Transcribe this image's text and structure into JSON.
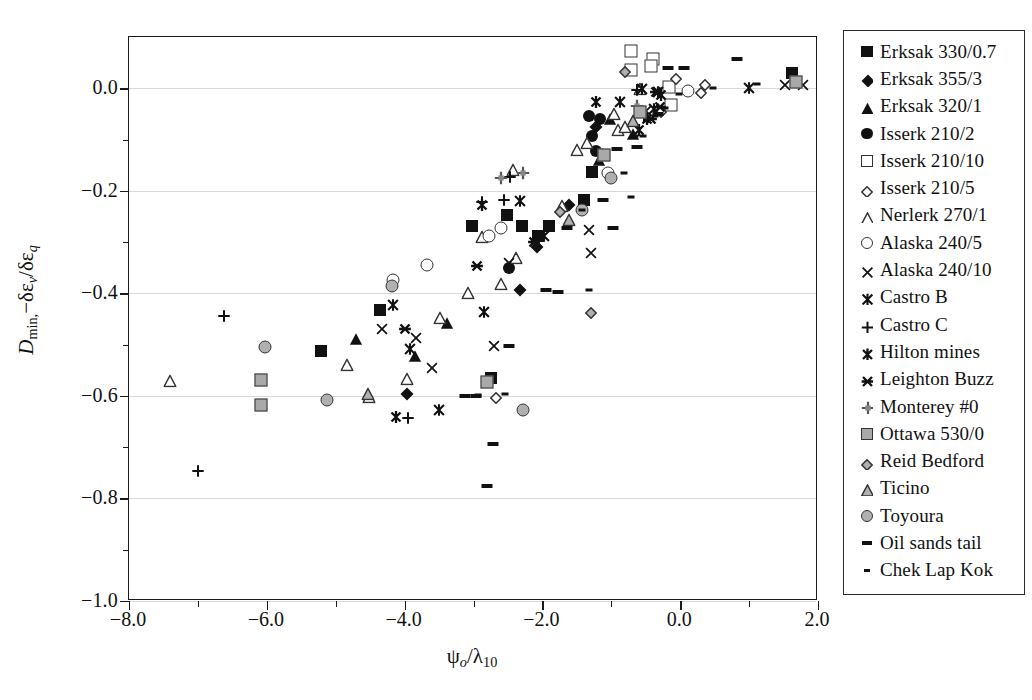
{
  "chart_data": {
    "type": "scatter",
    "title": "",
    "xlabel": "psi_o / lambda_10",
    "ylabel": "D_min, -delta-epsilon_v / delta-epsilon_q",
    "xlim": [
      -8.0,
      2.0
    ],
    "ylim": [
      -1.0,
      0.1
    ],
    "xticks": [
      "-8.0",
      "-6.0",
      "-4.0",
      "-2.0",
      "0.0",
      "2.0"
    ],
    "xtick_values": [
      -8.0,
      -6.0,
      -4.0,
      -2.0,
      0.0,
      2.0
    ],
    "xminor_values": [
      -7.0,
      -5.0,
      -3.0,
      -1.0,
      1.0
    ],
    "yticks": [
      "0.0",
      "-0.2",
      "-0.4",
      "-0.6",
      "-0.8",
      "-1.0"
    ],
    "ytick_values": [
      0.0,
      -0.2,
      -0.4,
      -0.6,
      -0.8,
      -1.0
    ],
    "yminor_values": [
      -0.1,
      -0.3,
      -0.5,
      -0.7,
      -0.9
    ],
    "grid": true,
    "grid_axis": "y",
    "legend_position": "right-outside",
    "series": [
      {
        "name": "Erksak 330/0.7",
        "marker": "square-filled",
        "points": [
          [
            -5.22,
            -0.512
          ],
          [
            -4.35,
            -0.433
          ],
          [
            -3.02,
            -0.268
          ],
          [
            -2.52,
            -0.248
          ],
          [
            -2.3,
            -0.268
          ],
          [
            -2.07,
            -0.288
          ],
          [
            -1.9,
            -0.268
          ],
          [
            -2.74,
            -0.565
          ],
          [
            -1.4,
            -0.218
          ],
          [
            -1.28,
            -0.163
          ],
          [
            1.62,
            0.03
          ]
        ]
      },
      {
        "name": "Erksak 355/3",
        "marker": "diamond-filled",
        "points": [
          [
            -3.96,
            -0.597
          ],
          [
            -2.08,
            -0.31
          ],
          [
            -1.62,
            -0.228
          ],
          [
            -2.33,
            -0.393
          ],
          [
            -1.22,
            -0.075
          ]
        ]
      },
      {
        "name": "Erksak 320/1",
        "marker": "triangle-filled",
        "points": [
          [
            -4.7,
            -0.487
          ],
          [
            -3.85,
            -0.52
          ],
          [
            -3.38,
            -0.455
          ],
          [
            -1.18,
            -0.138
          ],
          [
            -0.68,
            -0.088
          ],
          [
            -1.02,
            -0.058
          ]
        ]
      },
      {
        "name": "Isserk 210/2",
        "marker": "circle-filled",
        "points": [
          [
            -2.48,
            -0.35
          ],
          [
            -1.28,
            -0.093
          ],
          [
            -1.22,
            -0.123
          ],
          [
            -1.16,
            -0.06
          ],
          [
            -1.32,
            -0.055
          ]
        ]
      },
      {
        "name": "Isserk 210/10",
        "marker": "square-open",
        "points": [
          [
            -0.72,
            0.073
          ],
          [
            -0.72,
            0.035
          ],
          [
            -0.4,
            0.058
          ],
          [
            -0.42,
            0.043
          ],
          [
            -0.16,
            0.003
          ],
          [
            -0.14,
            -0.032
          ]
        ]
      },
      {
        "name": "Isserk 210/5",
        "marker": "diamond-small-open",
        "points": [
          [
            -2.68,
            -0.6
          ],
          [
            -0.06,
            0.022
          ],
          [
            0.36,
            0.01
          ],
          [
            0.3,
            -0.005
          ],
          [
            -0.28,
            -0.043
          ]
        ]
      },
      {
        "name": "Nerlerk 270/1",
        "marker": "triangle-open",
        "points": [
          [
            -7.4,
            -0.568
          ],
          [
            -4.83,
            -0.538
          ],
          [
            -4.52,
            -0.6
          ],
          [
            -3.96,
            -0.565
          ],
          [
            -3.48,
            -0.447
          ],
          [
            -3.08,
            -0.398
          ],
          [
            -2.88,
            -0.288
          ],
          [
            -2.6,
            -0.38
          ],
          [
            -2.43,
            -0.158
          ],
          [
            -2.38,
            -0.33
          ],
          [
            -1.72,
            -0.228
          ],
          [
            -1.5,
            -0.118
          ],
          [
            -1.35,
            -0.105
          ],
          [
            -1.12,
            -0.128
          ],
          [
            -0.96,
            -0.048
          ],
          [
            -0.9,
            -0.08
          ],
          [
            -0.8,
            -0.073
          ],
          [
            -0.58,
            0.0
          ]
        ]
      },
      {
        "name": "Alaska 240/5",
        "marker": "circle-open",
        "points": [
          [
            -4.17,
            -0.373
          ],
          [
            -3.67,
            -0.345
          ],
          [
            -2.78,
            -0.288
          ],
          [
            -2.6,
            -0.272
          ],
          [
            -1.05,
            -0.165
          ],
          [
            0.12,
            -0.005
          ]
        ]
      },
      {
        "name": "Alaska 240/10",
        "marker": "x-thin",
        "points": [
          [
            -4.33,
            -0.468
          ],
          [
            -3.83,
            -0.485
          ],
          [
            -3.6,
            -0.543
          ],
          [
            -2.7,
            -0.5
          ],
          [
            -2.48,
            -0.338
          ],
          [
            -1.33,
            -0.275
          ],
          [
            -1.3,
            -0.32
          ],
          [
            -0.5,
            -0.043
          ],
          [
            1.78,
            0.008
          ],
          [
            1.52,
            0.008
          ]
        ]
      },
      {
        "name": "Castro B",
        "marker": "x-bold",
        "points": [
          [
            -4.17,
            -0.42
          ],
          [
            -3.92,
            -0.507
          ],
          [
            -3.5,
            -0.625
          ],
          [
            -2.85,
            -0.435
          ],
          [
            -2.32,
            -0.218
          ],
          [
            -1.98,
            -0.287
          ],
          [
            -0.88,
            -0.025
          ],
          [
            -0.38,
            -0.038
          ],
          [
            -0.32,
            -0.005
          ],
          [
            -0.55,
            0.0
          ],
          [
            1.0,
            0.003
          ]
        ]
      },
      {
        "name": "Castro C",
        "marker": "plus-thin",
        "points": [
          [
            -6.62,
            -0.443
          ],
          [
            -7.0,
            -0.745
          ],
          [
            -3.95,
            -0.642
          ],
          [
            -2.88,
            -0.22
          ],
          [
            -2.56,
            -0.215
          ],
          [
            -2.47,
            -0.172
          ],
          [
            -0.62,
            -0.002
          ],
          [
            -0.52,
            -0.055
          ]
        ]
      },
      {
        "name": "Hilton mines",
        "marker": "x-star",
        "points": [
          [
            -4.12,
            -0.64
          ],
          [
            -2.88,
            -0.225
          ],
          [
            -1.22,
            -0.025
          ],
          [
            -0.6,
            -0.08
          ],
          [
            -0.48,
            -0.058
          ],
          [
            -0.28,
            -0.012
          ]
        ]
      },
      {
        "name": "Leighton Buzz",
        "marker": "x-heavy",
        "points": [
          [
            -4.0,
            -0.468
          ],
          [
            -2.95,
            -0.345
          ],
          [
            -2.12,
            -0.297
          ],
          [
            -0.42,
            -0.058
          ],
          [
            -0.35,
            -0.005
          ],
          [
            -0.3,
            -0.035
          ]
        ]
      },
      {
        "name": "Monterey #0",
        "marker": "plus-square",
        "points": [
          [
            -2.6,
            -0.175
          ],
          [
            -2.28,
            -0.165
          ],
          [
            -0.62,
            -0.035
          ]
        ]
      },
      {
        "name": "Ottawa 530/0",
        "marker": "square-gray",
        "points": [
          [
            -6.08,
            -0.568
          ],
          [
            -6.08,
            -0.617
          ],
          [
            -2.8,
            -0.572
          ],
          [
            -1.1,
            -0.13
          ],
          [
            -0.58,
            -0.047
          ],
          [
            1.68,
            0.012
          ]
        ]
      },
      {
        "name": "Reid Bedford",
        "marker": "diamond-small-gray",
        "points": [
          [
            -1.75,
            -0.237
          ],
          [
            -1.3,
            -0.435
          ],
          [
            -0.8,
            0.035
          ]
        ]
      },
      {
        "name": "Ticino",
        "marker": "triangle-gray",
        "points": [
          [
            -4.53,
            -0.595
          ],
          [
            -1.62,
            -0.255
          ],
          [
            -0.68,
            -0.062
          ]
        ]
      },
      {
        "name": "Toyoura",
        "marker": "circle-gray",
        "points": [
          [
            -6.02,
            -0.505
          ],
          [
            -4.18,
            -0.385
          ],
          [
            -5.12,
            -0.608
          ],
          [
            -2.28,
            -0.628
          ],
          [
            -1.42,
            -0.238
          ],
          [
            -1.0,
            -0.175
          ]
        ]
      },
      {
        "name": "Oil sands tail",
        "marker": "dash-thick",
        "points": [
          [
            -3.12,
            -0.6
          ],
          [
            -2.96,
            -0.6
          ],
          [
            -2.72,
            -0.693
          ],
          [
            -2.8,
            -0.775
          ],
          [
            -2.48,
            -0.502
          ],
          [
            -1.95,
            -0.393
          ],
          [
            -1.78,
            -0.398
          ],
          [
            -1.65,
            -0.273
          ],
          [
            -1.12,
            -0.218
          ],
          [
            -0.98,
            -0.273
          ],
          [
            -0.92,
            -0.118
          ],
          [
            -0.62,
            -0.115
          ],
          [
            -0.32,
            -0.05
          ],
          [
            -0.18,
            0.04
          ],
          [
            0.05,
            0.04
          ],
          [
            0.82,
            0.058
          ]
        ]
      },
      {
        "name": "Chek Lap Kok",
        "marker": "dash-thin",
        "points": [
          [
            -2.93,
            -0.598
          ],
          [
            -2.55,
            -0.597
          ],
          [
            -1.42,
            -0.238
          ],
          [
            -1.32,
            -0.393
          ],
          [
            -0.82,
            -0.165
          ],
          [
            -0.72,
            -0.212
          ],
          [
            -0.66,
            -0.093
          ],
          [
            -0.54,
            -0.093
          ],
          [
            -0.36,
            -0.055
          ],
          [
            -0.22,
            -0.038
          ],
          [
            -0.02,
            -0.012
          ],
          [
            0.48,
            0.0
          ],
          [
            1.12,
            0.008
          ]
        ]
      }
    ]
  },
  "axes": {
    "y_title_main": "D",
    "y_title_sub": "min,",
    "y_title_rest": "−δε",
    "y_title_sub2": "v",
    "y_title_slash": "/δε",
    "y_title_sub3": "q",
    "x_title_main": "ψ",
    "x_title_sub": "o",
    "x_title_slash": "/λ",
    "x_title_sub2": "10"
  },
  "legend": {
    "items": [
      {
        "label": "Erksak 330/0.7",
        "marker": "square-filled"
      },
      {
        "label": "Erksak 355/3",
        "marker": "diamond-filled"
      },
      {
        "label": "Erksak 320/1",
        "marker": "triangle-filled"
      },
      {
        "label": "Isserk 210/2",
        "marker": "circle-filled"
      },
      {
        "label": "Isserk 210/10",
        "marker": "square-open"
      },
      {
        "label": "Isserk 210/5",
        "marker": "diamond-small-open"
      },
      {
        "label": "Nerlerk 270/1",
        "marker": "triangle-open"
      },
      {
        "label": "Alaska 240/5",
        "marker": "circle-open"
      },
      {
        "label": "Alaska 240/10",
        "marker": "x-thin"
      },
      {
        "label": "Castro B",
        "marker": "x-bold"
      },
      {
        "label": "Castro C",
        "marker": "plus-thin"
      },
      {
        "label": "Hilton mines",
        "marker": "x-star"
      },
      {
        "label": "Leighton Buzz",
        "marker": "x-heavy"
      },
      {
        "label": "Monterey #0",
        "marker": "plus-square"
      },
      {
        "label": "Ottawa 530/0",
        "marker": "square-gray"
      },
      {
        "label": "Reid Bedford",
        "marker": "diamond-small-gray"
      },
      {
        "label": "Ticino",
        "marker": "triangle-gray"
      },
      {
        "label": "Toyoura",
        "marker": "circle-gray"
      },
      {
        "label": "Oil sands tail",
        "marker": "dash-thick"
      },
      {
        "label": "Chek Lap Kok",
        "marker": "dash-thin"
      }
    ]
  },
  "colors": {
    "ink": "#111111",
    "grid": "#d8d8d8",
    "gray_fill": "#a9a9a9",
    "frame": "#1a1a1a"
  }
}
